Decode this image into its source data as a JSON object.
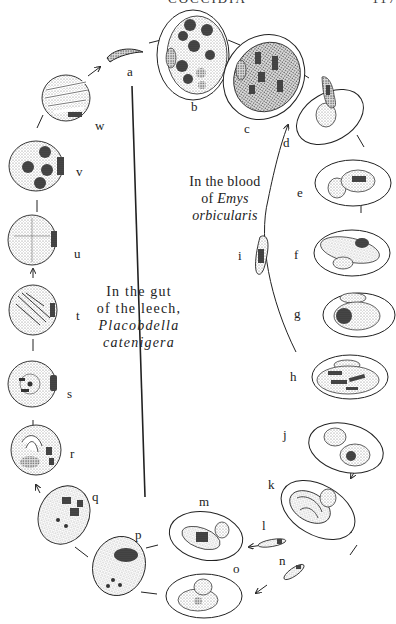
{
  "header": {
    "title": "COCCIDIA",
    "page_number": "117"
  },
  "captions": {
    "blood": {
      "line1": "In the blood",
      "line2_prefix": "of ",
      "line2_italic": "Emys",
      "line3_italic": "orbicularis"
    },
    "gut": {
      "line1": "In the gut",
      "line2": "of the leech,",
      "line3_italic": "Placobdella",
      "line4_italic": "catenigera"
    }
  },
  "stages": [
    {
      "id": "a",
      "label": "a"
    },
    {
      "id": "b",
      "label": "b"
    },
    {
      "id": "c",
      "label": "c"
    },
    {
      "id": "d",
      "label": "d"
    },
    {
      "id": "e",
      "label": "e"
    },
    {
      "id": "f",
      "label": "f"
    },
    {
      "id": "g",
      "label": "g"
    },
    {
      "id": "h",
      "label": "h"
    },
    {
      "id": "i",
      "label": "i"
    },
    {
      "id": "j",
      "label": "j"
    },
    {
      "id": "k",
      "label": "k"
    },
    {
      "id": "l",
      "label": "l"
    },
    {
      "id": "m",
      "label": "m"
    },
    {
      "id": "n",
      "label": "n"
    },
    {
      "id": "o",
      "label": "o"
    },
    {
      "id": "p",
      "label": "p"
    },
    {
      "id": "q",
      "label": "q"
    },
    {
      "id": "r",
      "label": "r"
    },
    {
      "id": "s",
      "label": "s"
    },
    {
      "id": "t",
      "label": "t"
    },
    {
      "id": "u",
      "label": "u"
    },
    {
      "id": "v",
      "label": "v"
    },
    {
      "id": "w",
      "label": "w"
    }
  ],
  "colors": {
    "ink": "#222222",
    "stipple": "#9a9a9a",
    "dark": "#333333",
    "paper": "#ffffff"
  }
}
